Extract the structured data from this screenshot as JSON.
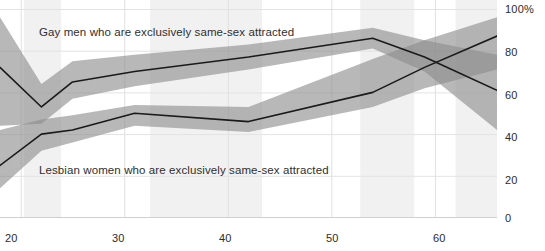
{
  "chart_data": {
    "type": "line",
    "title": "",
    "subtitle": "",
    "xlabel": "",
    "ylabel": "",
    "xlim": [
      18,
      66
    ],
    "ylim": [
      0,
      100
    ],
    "grid": true,
    "legend_position": "inline-annotation",
    "x_ticks": [
      "20",
      "30",
      "40",
      "50",
      "60"
    ],
    "x_tick_values": [
      20,
      30,
      40,
      50,
      60
    ],
    "y_ticks": [
      "0",
      "20",
      "40",
      "60",
      "80",
      "100%"
    ],
    "y_tick_values": [
      0,
      20,
      40,
      60,
      80,
      100
    ],
    "band_color": "#8c8c8c",
    "line_color": "#1a1a1a",
    "series": [
      {
        "name": "Gay men who are exclusively same-sex attracted",
        "annotation": "Gay men who are exclusively same-sex attracted",
        "x": [
          18,
          22,
          25,
          31,
          42,
          54,
          59,
          66
        ],
        "values": [
          72,
          53,
          65,
          70,
          77,
          86,
          77,
          61
        ],
        "band_lower": [
          44,
          45,
          57,
          63,
          71,
          81,
          70,
          42
        ],
        "band_upper": [
          96,
          64,
          75,
          78,
          83,
          91,
          85,
          78
        ]
      },
      {
        "name": "Lesbian women who are exclusively same-sex attracted",
        "annotation": "Lesbian women who are exclusively same-sex attracted",
        "x": [
          18,
          22,
          25,
          31,
          42,
          54,
          59,
          66
        ],
        "values": [
          25,
          40,
          42,
          50,
          46,
          60,
          72,
          87
        ],
        "band_lower": [
          14,
          32,
          36,
          44,
          41,
          53,
          62,
          71
        ],
        "band_upper": [
          42,
          47,
          49,
          54,
          53,
          76,
          85,
          96
        ]
      }
    ],
    "shaded_x_regions": [
      {
        "x0": 20.3,
        "x1": 23.9
      },
      {
        "x0": 32.5,
        "x1": 38.0
      },
      {
        "x0": 38.0,
        "x1": 43.3
      },
      {
        "x0": 52.8,
        "x1": 58.0
      },
      {
        "x0": 62.0,
        "x1": 66.0
      }
    ]
  },
  "annotations": {
    "men": "Gay men who are exclusively same-sex attracted",
    "women": "Lesbian women who are exclusively same-sex attracted"
  },
  "axis": {
    "y_labels": [
      "100%",
      "80",
      "60",
      "40",
      "20",
      "0"
    ],
    "x_labels": [
      "20",
      "30",
      "40",
      "50",
      "60"
    ]
  }
}
